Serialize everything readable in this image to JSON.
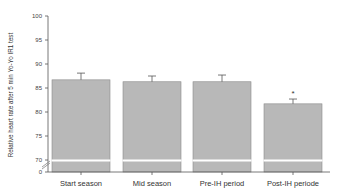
{
  "chart_data": {
    "type": "bar",
    "title": "",
    "xlabel": "",
    "ylabel": "Relative heart rate after 5 min Yo-Yo IR1 test",
    "categories": [
      "Start season",
      "Mid season",
      "Pre-IH period",
      "Post-IH periode"
    ],
    "values": [
      86.7,
      86.3,
      86.3,
      81.7
    ],
    "error_bars": [
      1.4,
      1.2,
      1.4,
      1.0
    ],
    "annotations": [
      {
        "category": "Post-IH periode",
        "text": "*"
      }
    ],
    "yticks": [
      0,
      70,
      75,
      80,
      85,
      90,
      95,
      100
    ],
    "ylim": [
      0,
      100
    ],
    "axis_break": {
      "from": 0,
      "to": 70
    },
    "grid": false,
    "legend": null,
    "bar_color": "#b8b8b8",
    "bar_edge_color": "#8a8a8a"
  }
}
